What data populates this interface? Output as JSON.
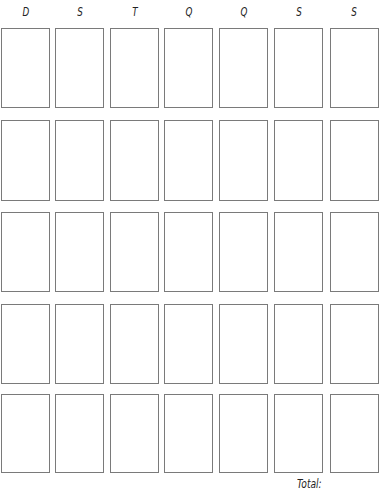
{
  "headers": [
    "D",
    "S",
    "T",
    "Q",
    "Q",
    "S",
    "S"
  ],
  "rows": 5,
  "total_label": "Total:",
  "colors": {
    "border": "#7a7a7a",
    "text": "#222222",
    "background": "#ffffff"
  }
}
